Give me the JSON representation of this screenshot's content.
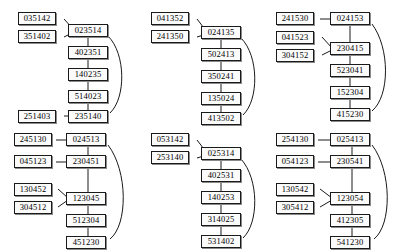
{
  "figure": {
    "type": "diagram-grid",
    "rows": 2,
    "columns": 3,
    "node_shape": "rectangle",
    "edge_style": "straight-and-curved",
    "colors": {
      "background": "#ffffff",
      "node_fill": "#fbfbfb",
      "node_border": "#1a1a1a",
      "node_shadow": "#8a8a8a",
      "edge": "#1a1a1a",
      "text": "#000000"
    }
  },
  "diagrams": [
    {
      "id": "diagram-1",
      "position": "top-left",
      "chain": [
        "023514",
        "402351",
        "140235",
        "514023",
        "235140"
      ],
      "side_nodes": [
        {
          "label": "035142",
          "attaches_to": "023514"
        },
        {
          "label": "351402",
          "attaches_to": "023514"
        },
        {
          "label": "251403",
          "attaches_to": "235140"
        }
      ],
      "arc": {
        "from": "023514",
        "to": "235140"
      }
    },
    {
      "id": "diagram-2",
      "position": "top-center",
      "chain": [
        "024135",
        "502413",
        "350241",
        "135024",
        "413502"
      ],
      "side_nodes": [
        {
          "label": "041352",
          "attaches_to": "024135"
        },
        {
          "label": "241350",
          "attaches_to": "024135"
        }
      ],
      "arc": {
        "from": "024135",
        "to": "413502"
      }
    },
    {
      "id": "diagram-3",
      "position": "top-right",
      "chain": [
        "024153",
        "230415",
        "523041",
        "152304",
        "415230"
      ],
      "side_nodes": [
        {
          "label": "241530",
          "attaches_to": "024153"
        },
        {
          "label": "041523",
          "attaches_to": "230415"
        },
        {
          "label": "304152",
          "attaches_to": "230415"
        }
      ],
      "arc": {
        "from": "024153",
        "to": "415230"
      }
    },
    {
      "id": "diagram-4",
      "position": "bottom-left",
      "chain": [
        "024513",
        "230451",
        "123045",
        "512304",
        "451230"
      ],
      "side_nodes": [
        {
          "label": "245130",
          "attaches_to": "024513"
        },
        {
          "label": "045123",
          "attaches_to": "230451"
        },
        {
          "label": "130452",
          "attaches_to": "123045"
        },
        {
          "label": "304512",
          "attaches_to": "123045"
        }
      ],
      "arc": {
        "from": "024513",
        "to": "451230"
      }
    },
    {
      "id": "diagram-5",
      "position": "bottom-center",
      "chain": [
        "025314",
        "402531",
        "140253",
        "314025",
        "531402"
      ],
      "side_nodes": [
        {
          "label": "053142",
          "attaches_to": "025314"
        },
        {
          "label": "253140",
          "attaches_to": "025314"
        }
      ],
      "arc": {
        "from": "025314",
        "to": "531402"
      }
    },
    {
      "id": "diagram-6",
      "position": "bottom-right",
      "chain": [
        "025413",
        "230541",
        "123054",
        "412305",
        "541230"
      ],
      "side_nodes": [
        {
          "label": "254130",
          "attaches_to": "025413"
        },
        {
          "label": "054123",
          "attaches_to": "230541"
        },
        {
          "label": "130542",
          "attaches_to": "123054"
        },
        {
          "label": "305412",
          "attaches_to": "123054"
        }
      ],
      "arc": {
        "from": "025413",
        "to": "541230"
      }
    }
  ]
}
